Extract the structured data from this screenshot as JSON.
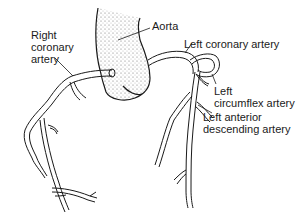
{
  "diagram": {
    "labels": {
      "aorta": "Aorta",
      "right_coronary_line1": "Right",
      "right_coronary_line2": "coronary",
      "right_coronary_line3": "artery",
      "left_coronary": "Left coronary artery",
      "left_circumflex_line1": "Left",
      "left_circumflex_line2": "circumflex artery",
      "lad_line1": "Left anterior",
      "lad_line2": "descending artery"
    },
    "colors": {
      "ink": "#1a1a1a",
      "background": "#ffffff",
      "stipple": "#555555"
    }
  }
}
